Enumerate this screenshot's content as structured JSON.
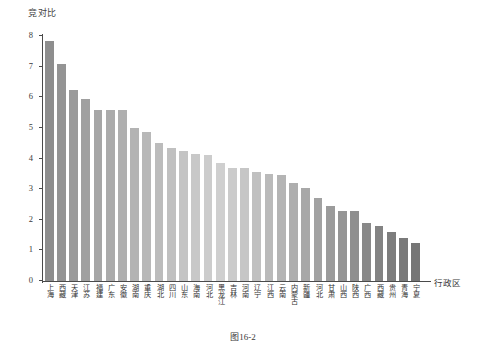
{
  "figure": {
    "caption": "图16-2"
  },
  "chart_data": {
    "type": "bar",
    "title": "",
    "ylabel": "竞对比",
    "xlabel": "行政区",
    "ylim": [
      0,
      8
    ],
    "yticks": [
      0,
      1,
      2,
      3,
      4,
      5,
      6,
      7,
      8
    ],
    "ytick_labels": [
      "0",
      "1",
      "2",
      "3",
      "4",
      "5",
      "6",
      "7",
      "8"
    ],
    "grid": false,
    "legend": "none",
    "sorted": "descending",
    "categories": [
      "上海",
      "西藏",
      "天津",
      "江苏",
      "福建",
      "广东",
      "安徽",
      "湖南",
      "重庆",
      "湖北",
      "四川",
      "山东",
      "海南",
      "河北",
      "黑龙江",
      "吉林",
      "河南",
      "辽宁",
      "江西",
      "云南",
      "内蒙古",
      "新疆",
      "河北",
      "甘肃",
      "山西",
      "陕西",
      "广西",
      "西藏",
      "贵州",
      "青海",
      "宁夏"
    ],
    "values": [
      7.85,
      7.1,
      6.25,
      5.95,
      5.6,
      5.6,
      5.6,
      5.0,
      4.85,
      4.5,
      4.35,
      4.25,
      4.15,
      4.1,
      3.85,
      3.7,
      3.7,
      3.55,
      3.5,
      3.45,
      3.2,
      3.05,
      2.7,
      2.45,
      2.3,
      2.3,
      1.9,
      1.8,
      1.6,
      1.4,
      1.25
    ],
    "bar_colors": [
      "#8e8e8e",
      "#949494",
      "#9a9a9a",
      "#a0a0a0",
      "#a6a6a6",
      "#ababab",
      "#afafaf",
      "#b3b3b3",
      "#b8b8b8",
      "#bcbcbc",
      "#c0c0c0",
      "#c4c4c4",
      "#c8c8c8",
      "#cccccc",
      "#cfcfcf",
      "#cbcbcb",
      "#c6c6c6",
      "#c0c0c0",
      "#bababa",
      "#b4b4b4",
      "#aeaeae",
      "#a8a8a8",
      "#a2a2a2",
      "#9b9b9b",
      "#959595",
      "#8f8f8f",
      "#898989",
      "#838383",
      "#7d7d7d",
      "#7a7a7a",
      "#767676"
    ],
    "axis_color": "#4a4a4a",
    "background": "#ffffff"
  }
}
